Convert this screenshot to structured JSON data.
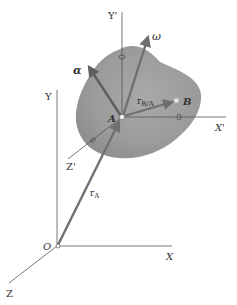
{
  "figure": {
    "type": "rigid-body-kinematics-diagram",
    "labels": {
      "origin": "O",
      "x_axis": "X",
      "y_axis": "Y",
      "z_axis": "Z",
      "x_prime_axis": "X'",
      "y_prime_axis": "Y'",
      "z_prime_axis": "Z'",
      "point_a": "A",
      "point_b": "B",
      "omega": "ω",
      "alpha": "α",
      "r_a_main": "r",
      "r_a_sub": "A",
      "r_ba_main": "r",
      "r_ba_sub": "B/A"
    },
    "colors": {
      "body_fill": "#9a9a9a",
      "vector": "#6e6e6e",
      "axis": "#555555",
      "background": "#ffffff"
    }
  }
}
